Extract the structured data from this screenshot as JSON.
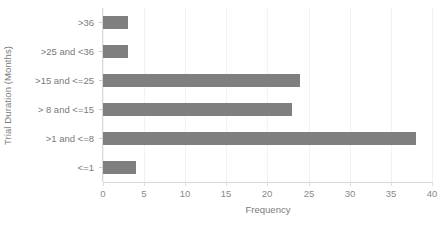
{
  "chart_data": {
    "type": "bar",
    "orientation": "horizontal",
    "title": "",
    "xlabel": "Frequency",
    "ylabel": "Trial Duration (Months)",
    "categories": [
      "<=1",
      ">1 and <=8",
      "> 8 and <=15",
      ">15 and <=25",
      ">25 and <36",
      ">36"
    ],
    "values": [
      4,
      38,
      23,
      24,
      3,
      3
    ],
    "series": [
      {
        "name": "Frequency",
        "values": [
          4,
          38,
          23,
          24,
          3,
          3
        ]
      }
    ],
    "xlim": [
      0,
      40
    ],
    "xticks": [
      0,
      5,
      10,
      15,
      20,
      25,
      30,
      35,
      40
    ],
    "xtick_labels": [
      "0",
      "5",
      "10",
      "15",
      "20",
      "25",
      "30",
      "35",
      "40"
    ],
    "grid": "vertical",
    "legend": "none",
    "bar_color": "#7f7f7f",
    "gridline_color": "#f2f2f2",
    "axis_color": "#d9d9d9",
    "text_color": "#808080"
  },
  "axes": {
    "y_title": "Trial Duration (Months)",
    "x_title": "Frequency",
    "y_categories_top_to_bottom": [
      ">36",
      ">25 and <36",
      ">15 and <=25",
      "> 8 and <=15",
      ">1 and <=8",
      "<=1"
    ],
    "y_values_top_to_bottom": [
      3,
      3,
      24,
      23,
      38,
      4
    ],
    "x_ticks": [
      "0",
      "5",
      "10",
      "15",
      "20",
      "25",
      "30",
      "35",
      "40"
    ]
  }
}
